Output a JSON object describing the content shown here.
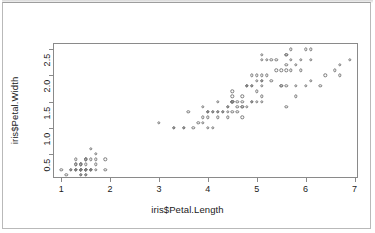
{
  "window": {
    "background_color": "#ffffff",
    "frame_color": "#b9b9b9"
  },
  "chart_data": {
    "type": "scatter",
    "title": "",
    "subtitle": "",
    "xlabel": "iris$Petal.Length",
    "ylabel": "iris$Petal.Width",
    "xticks": [
      "1",
      "2",
      "3",
      "4",
      "5",
      "6",
      "7"
    ],
    "xtick_values": [
      1,
      2,
      3,
      4,
      5,
      6,
      7
    ],
    "yticks": [
      "0.5",
      "1.0",
      "1.5",
      "2.0",
      "2.5"
    ],
    "ytick_values": [
      0.5,
      1.0,
      1.5,
      2.0,
      2.5
    ],
    "xlim": [
      0.83,
      7.07
    ],
    "ylim": [
      0.04,
      2.62
    ],
    "grid": false,
    "legend": null,
    "marker": "open-circle",
    "marker_color": "#7a7a7a",
    "annotations": [],
    "x": [
      1.4,
      1.4,
      1.3,
      1.5,
      1.4,
      1.7,
      1.4,
      1.5,
      1.4,
      1.5,
      1.5,
      1.6,
      1.4,
      1.1,
      1.2,
      1.5,
      1.3,
      1.4,
      1.7,
      1.5,
      1.7,
      1.5,
      1.0,
      1.7,
      1.9,
      1.6,
      1.6,
      1.5,
      1.4,
      1.6,
      1.6,
      1.5,
      1.5,
      1.4,
      1.5,
      1.2,
      1.3,
      1.4,
      1.3,
      1.5,
      1.3,
      1.3,
      1.3,
      1.6,
      1.9,
      1.4,
      1.6,
      1.4,
      1.5,
      1.4,
      4.7,
      4.5,
      4.9,
      4.0,
      4.6,
      4.5,
      4.7,
      3.3,
      4.6,
      3.9,
      3.5,
      4.2,
      4.0,
      4.7,
      3.6,
      4.4,
      4.5,
      4.1,
      4.5,
      3.9,
      4.8,
      4.0,
      4.9,
      4.7,
      4.3,
      4.4,
      4.8,
      5.0,
      4.5,
      3.5,
      3.8,
      3.7,
      3.9,
      5.1,
      4.5,
      4.5,
      4.7,
      4.4,
      4.1,
      4.0,
      4.4,
      4.6,
      4.0,
      3.3,
      4.2,
      4.2,
      4.2,
      4.3,
      3.0,
      4.1,
      6.0,
      5.1,
      5.9,
      5.6,
      5.8,
      6.6,
      4.5,
      6.3,
      5.8,
      6.1,
      5.1,
      5.3,
      5.5,
      5.0,
      5.1,
      5.3,
      5.5,
      6.7,
      6.9,
      5.0,
      5.7,
      4.9,
      6.7,
      4.9,
      5.7,
      6.0,
      4.8,
      4.9,
      5.6,
      5.8,
      6.1,
      6.4,
      5.6,
      5.1,
      5.6,
      6.1,
      5.6,
      5.5,
      4.8,
      5.4,
      5.6,
      5.1,
      5.1,
      5.9,
      5.7,
      5.2,
      5.0,
      5.2,
      5.4,
      5.1
    ],
    "y": [
      0.2,
      0.2,
      0.2,
      0.2,
      0.2,
      0.4,
      0.3,
      0.2,
      0.2,
      0.1,
      0.2,
      0.2,
      0.1,
      0.1,
      0.2,
      0.4,
      0.4,
      0.3,
      0.3,
      0.3,
      0.2,
      0.4,
      0.2,
      0.5,
      0.2,
      0.2,
      0.4,
      0.2,
      0.2,
      0.2,
      0.2,
      0.4,
      0.1,
      0.2,
      0.2,
      0.2,
      0.2,
      0.1,
      0.2,
      0.2,
      0.3,
      0.3,
      0.2,
      0.6,
      0.4,
      0.3,
      0.2,
      0.2,
      0.2,
      0.2,
      1.4,
      1.5,
      1.5,
      1.3,
      1.5,
      1.3,
      1.6,
      1.0,
      1.3,
      1.4,
      1.0,
      1.5,
      1.0,
      1.4,
      1.3,
      1.4,
      1.5,
      1.0,
      1.5,
      1.1,
      1.8,
      1.3,
      1.5,
      1.2,
      1.3,
      1.4,
      1.4,
      1.7,
      1.5,
      1.0,
      1.1,
      1.0,
      1.2,
      1.6,
      1.5,
      1.6,
      1.5,
      1.3,
      1.3,
      1.3,
      1.2,
      1.4,
      1.2,
      1.0,
      1.3,
      1.2,
      1.3,
      1.3,
      1.1,
      1.3,
      2.5,
      1.9,
      2.1,
      1.8,
      2.2,
      2.1,
      1.7,
      1.8,
      1.8,
      2.5,
      2.0,
      1.9,
      2.1,
      2.0,
      2.4,
      2.3,
      1.8,
      2.2,
      2.3,
      1.5,
      2.3,
      2.0,
      2.0,
      1.8,
      2.1,
      1.8,
      1.8,
      1.8,
      2.1,
      1.6,
      1.9,
      2.0,
      2.2,
      1.5,
      1.4,
      2.3,
      2.4,
      1.8,
      1.8,
      2.1,
      2.4,
      2.3,
      1.9,
      2.3,
      2.5,
      2.3,
      1.9,
      2.0,
      2.3,
      1.8
    ]
  }
}
